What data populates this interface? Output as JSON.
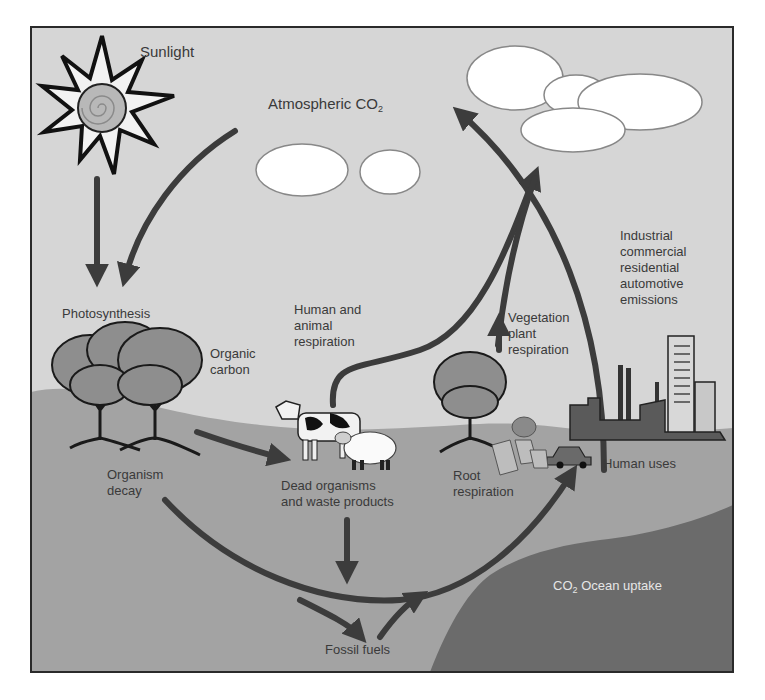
{
  "diagram": {
    "title_labels": {
      "sunlight": "Sunlight",
      "atmospheric_co2_prefix": "Atmospheric CO",
      "atmospheric_co2_sub": "2"
    },
    "labels": {
      "photosynthesis": "Photosynthesis",
      "organic_carbon": "Organic\ncarbon",
      "human_animal_respiration": "Human and\nanimal\nrespiration",
      "vegetation_plant_respiration": "Vegetation\nplant\nrespiration",
      "emissions": "Industrial\ncommercial\nresidential\nautomotive\nemissions",
      "organism_decay": "Organism\ndecay",
      "dead_organisms": "Dead organisms\nand waste products",
      "root_respiration": "Root\nrespiration",
      "human_uses": "Human uses",
      "ocean_uptake_prefix": "CO",
      "ocean_uptake_sub": "2",
      "ocean_uptake_suffix": " Ocean uptake",
      "fossil_fuels": "Fossil fuels"
    },
    "icons": [
      "sun-icon",
      "cloud-icon",
      "tree-icon",
      "cow-icon",
      "sheep-icon",
      "city-icon",
      "car-icon",
      "arrow-icon"
    ],
    "colors": {
      "sky": "#d6d6d6",
      "ground": "#a3a3a3",
      "ocean": "#6b6b6b",
      "arrow": "#3c3c3c",
      "border": "#2a2a2a",
      "text": "#3a3a3a",
      "cloud": "#ffffff"
    }
  }
}
